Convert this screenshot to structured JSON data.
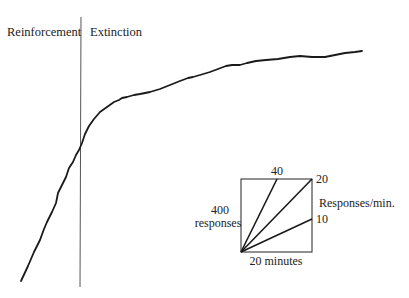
{
  "chart_data": {
    "type": "line",
    "title": "",
    "xlabel": "",
    "ylabel": "",
    "grid": false,
    "phases": [
      {
        "name": "Reinforcement",
        "label": "Reinforcement"
      },
      {
        "name": "Extinction",
        "label": "Extinction"
      }
    ],
    "phase_divider": {
      "x_px": [
        81,
        80
      ],
      "y_px": [
        17,
        287
      ]
    },
    "series": [
      {
        "name": "Cumulative responses",
        "color": "#1a1a1a",
        "points_px": [
          [
            21,
            281
          ],
          [
            28,
            266
          ],
          [
            34,
            252
          ],
          [
            40,
            240
          ],
          [
            44,
            229
          ],
          [
            47,
            222
          ],
          [
            52,
            212
          ],
          [
            56,
            203
          ],
          [
            58,
            193
          ],
          [
            63,
            183
          ],
          [
            66,
            177
          ],
          [
            69,
            168
          ],
          [
            73,
            162
          ],
          [
            76,
            155
          ],
          [
            79,
            150
          ],
          [
            82,
            143
          ],
          [
            85,
            134
          ],
          [
            89,
            126
          ],
          [
            94,
            119
          ],
          [
            100,
            112
          ],
          [
            107,
            107
          ],
          [
            114,
            102
          ],
          [
            119,
            100
          ],
          [
            122,
            98
          ],
          [
            127,
            97
          ],
          [
            134,
            95
          ],
          [
            140,
            94
          ],
          [
            150,
            92
          ],
          [
            160,
            89
          ],
          [
            170,
            85
          ],
          [
            180,
            81
          ],
          [
            188,
            78
          ],
          [
            193,
            77
          ],
          [
            200,
            75
          ],
          [
            210,
            72
          ],
          [
            218,
            69
          ],
          [
            226,
            66
          ],
          [
            232,
            65
          ],
          [
            240,
            65
          ],
          [
            247,
            63
          ],
          [
            256,
            61
          ],
          [
            266,
            60
          ],
          [
            278,
            59
          ],
          [
            290,
            57
          ],
          [
            300,
            56
          ],
          [
            312,
            57
          ],
          [
            325,
            57
          ],
          [
            335,
            55
          ],
          [
            345,
            53
          ],
          [
            355,
            52
          ],
          [
            362,
            51
          ]
        ]
      }
    ],
    "inset_scale": {
      "box_px": {
        "left": 241,
        "top": 179,
        "right": 312,
        "bottom": 252
      },
      "y_label": [
        "400",
        "responses"
      ],
      "x_label": "20 minutes",
      "rate_label": "Responses/min.",
      "rate_lines": [
        {
          "rate": 40,
          "label": "40",
          "end_px": [
            277,
            179
          ]
        },
        {
          "rate": 20,
          "label": "20",
          "end_px": [
            312,
            179
          ]
        },
        {
          "rate": 10,
          "label": "10",
          "end_px": [
            312,
            219
          ]
        }
      ]
    }
  },
  "labels": {
    "reinforcement": "Reinforcement",
    "extinction": "Extinction",
    "inset_y_line1": "400",
    "inset_y_line2": "responses",
    "inset_x": "20 minutes",
    "inset_rate_title": "Responses/min.",
    "rate_40": "40",
    "rate_20": "20",
    "rate_10": "10"
  }
}
